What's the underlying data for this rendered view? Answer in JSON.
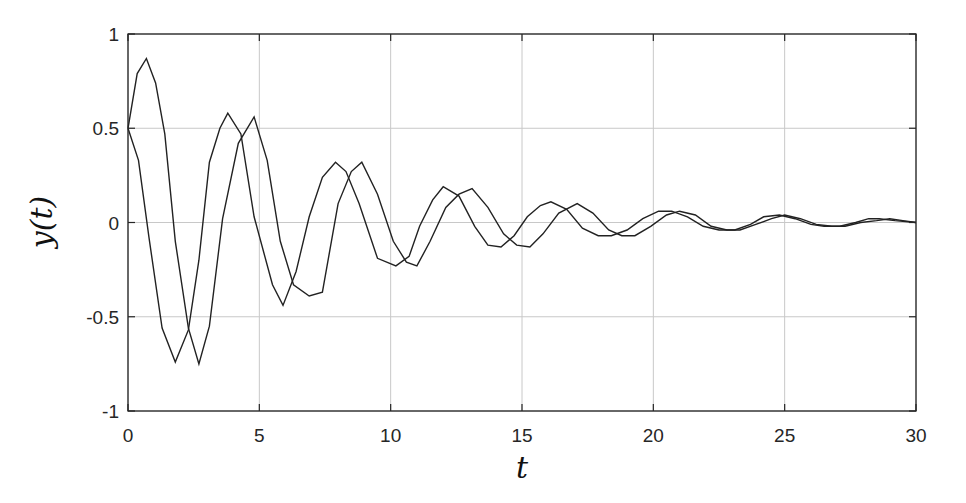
{
  "chart_data": {
    "type": "line",
    "title": "",
    "xlabel": "t",
    "ylabel": "y(t)",
    "xlim": [
      0,
      30
    ],
    "ylim": [
      -1,
      1
    ],
    "grid": true,
    "legend": null,
    "xticks": [
      0,
      5,
      10,
      15,
      20,
      25,
      30
    ],
    "xtick_labels": [
      "0",
      "5",
      "10",
      "15",
      "20",
      "25",
      "30"
    ],
    "yticks": [
      -1,
      -0.5,
      0,
      0.5,
      1
    ],
    "ytick_labels": [
      "-1",
      "-0.5",
      "0",
      "0.5",
      "1"
    ],
    "line_color": "#222222",
    "series": [
      {
        "name": "y1",
        "x": [
          0,
          0.35,
          0.7,
          1.05,
          1.4,
          1.8,
          2.3,
          2.7,
          3.1,
          3.6,
          4.2,
          4.8,
          5.3,
          5.8,
          6.3,
          6.9,
          7.4,
          8.0,
          8.5,
          8.9,
          9.5,
          10.1,
          10.6,
          11.0,
          11.5,
          12.1,
          12.6,
          13.1,
          13.7,
          14.3,
          14.8,
          15.3,
          15.8,
          16.4,
          17.1,
          17.7,
          18.3,
          18.8,
          19.3,
          19.9,
          20.5,
          21.0,
          21.6,
          22.2,
          22.8,
          23.3,
          23.9,
          24.5,
          25.0,
          25.6,
          26.2,
          26.8,
          27.3,
          27.9,
          28.5,
          29.0,
          29.5,
          30.0
        ],
        "y": [
          0.5,
          0.79,
          0.87,
          0.74,
          0.47,
          -0.1,
          -0.56,
          -0.75,
          -0.55,
          0.02,
          0.42,
          0.56,
          0.33,
          -0.1,
          -0.33,
          -0.39,
          -0.37,
          0.1,
          0.27,
          0.32,
          0.15,
          -0.1,
          -0.21,
          -0.23,
          -0.1,
          0.08,
          0.15,
          0.18,
          0.08,
          -0.06,
          -0.12,
          -0.13,
          -0.06,
          0.05,
          0.1,
          0.05,
          -0.04,
          -0.07,
          -0.07,
          -0.02,
          0.04,
          0.06,
          0.04,
          -0.02,
          -0.04,
          -0.04,
          -0.01,
          0.02,
          0.04,
          0.02,
          -0.01,
          -0.02,
          -0.02,
          0.0,
          0.01,
          0.02,
          0.01,
          0.0
        ]
      },
      {
        "name": "y2",
        "x": [
          0,
          0.4,
          0.8,
          1.3,
          1.8,
          2.3,
          2.7,
          3.1,
          3.5,
          3.8,
          4.3,
          4.8,
          5.5,
          5.9,
          6.4,
          6.9,
          7.4,
          7.9,
          8.3,
          8.8,
          9.5,
          10.2,
          10.7,
          11.1,
          11.6,
          12.0,
          12.6,
          13.2,
          13.7,
          14.2,
          14.7,
          15.2,
          15.7,
          16.1,
          16.7,
          17.3,
          17.9,
          18.4,
          19.0,
          19.6,
          20.2,
          20.7,
          21.3,
          21.9,
          22.5,
          23.1,
          23.7,
          24.2,
          24.8,
          25.4,
          26.0,
          26.5,
          27.1,
          27.7,
          28.2,
          28.6,
          29.2,
          30.0
        ],
        "y": [
          0.5,
          0.33,
          -0.08,
          -0.56,
          -0.74,
          -0.57,
          -0.2,
          0.32,
          0.5,
          0.58,
          0.47,
          0.03,
          -0.33,
          -0.44,
          -0.26,
          0.03,
          0.24,
          0.32,
          0.27,
          0.1,
          -0.19,
          -0.23,
          -0.18,
          -0.02,
          0.12,
          0.19,
          0.14,
          -0.02,
          -0.12,
          -0.13,
          -0.07,
          0.03,
          0.09,
          0.11,
          0.07,
          -0.03,
          -0.07,
          -0.07,
          -0.04,
          0.02,
          0.06,
          0.06,
          0.03,
          -0.02,
          -0.04,
          -0.04,
          -0.01,
          0.03,
          0.04,
          0.02,
          -0.01,
          -0.02,
          -0.02,
          0.0,
          0.02,
          0.02,
          0.01,
          0.0
        ]
      }
    ]
  }
}
